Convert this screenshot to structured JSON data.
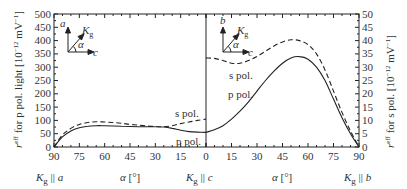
{
  "chart_data": {
    "type": "line",
    "title": "",
    "panels": [
      {
        "name": "left",
        "x_direction": "reversed",
        "x_ticks": [
          90,
          75,
          60,
          45,
          30,
          15,
          0
        ],
        "x_start_label": "K_g || a",
        "x_end_label": "K_g || c",
        "xlabel": "α [°]",
        "ylabel": "r^eff for p pol. light [10^-12 mV^-1]",
        "ylim": [
          0,
          500
        ],
        "y_ticks": [
          0,
          50,
          100,
          150,
          200,
          250,
          300,
          350,
          400,
          450,
          500
        ],
        "inset": {
          "vertical_axis": "a",
          "horizontal_axis": "c",
          "vector": "K_g",
          "angle": "α"
        },
        "series": [
          {
            "name": "s pol.",
            "style": "dashed",
            "x": [
              90,
              85,
              80,
              75,
              70,
              65,
              60,
              55,
              50,
              45,
              40,
              35,
              30,
              25,
              20,
              15,
              10,
              5,
              0
            ],
            "y": [
              0,
              45,
              70,
              85,
              92,
              95,
              94,
              92,
              89,
              85,
              82,
              79,
              77,
              76,
              80,
              88,
              94,
              100,
              105
            ]
          },
          {
            "name": "p pol.",
            "style": "solid",
            "x": [
              90,
              85,
              80,
              75,
              70,
              65,
              60,
              55,
              50,
              45,
              40,
              35,
              30,
              25,
              20,
              15,
              10,
              5,
              0
            ],
            "y": [
              0,
              38,
              60,
              72,
              78,
              80,
              80,
              79,
              78,
              77,
              76,
              76,
              76,
              75,
              70,
              63,
              58,
              56,
              55
            ]
          }
        ],
        "annotations": [
          "s pol.",
          "p pol."
        ]
      },
      {
        "name": "right",
        "x_direction": "normal",
        "x_ticks": [
          0,
          15,
          30,
          45,
          60,
          75,
          90
        ],
        "x_start_label": "K_g || c",
        "x_end_label": "K_g || b",
        "xlabel": "α [°]",
        "ylabel": "r^eff for s pol. [10^-12 mV^-1]",
        "ylim": [
          0,
          50
        ],
        "y_ticks": [
          0,
          5,
          10,
          15,
          20,
          25,
          30,
          35,
          40,
          45,
          50
        ],
        "inset": {
          "vertical_axis": "b",
          "horizontal_axis": "c",
          "vector": "K_g",
          "angle": "α"
        },
        "series": [
          {
            "name": "s pol.",
            "style": "dashed",
            "x": [
              0,
              5,
              10,
              15,
              20,
              25,
              30,
              35,
              40,
              45,
              50,
              55,
              60,
              65,
              70,
              75,
              80,
              85,
              90
            ],
            "y": [
              33.5,
              33.3,
              32.5,
              31.5,
              31.5,
              32.5,
              34,
              36,
              38,
              39.5,
              40.3,
              40,
              38.5,
              35,
              29,
              21,
              13,
              6,
              0
            ]
          },
          {
            "name": "p pol.",
            "style": "solid",
            "x": [
              0,
              5,
              10,
              15,
              20,
              25,
              30,
              35,
              40,
              45,
              50,
              55,
              60,
              65,
              70,
              75,
              80,
              85,
              90
            ],
            "y": [
              5.5,
              6.5,
              8,
              10.5,
              13.5,
              17,
              21,
              25,
              28.5,
              31.5,
              33.5,
              34,
              33,
              30,
              25,
              18,
              11,
              5,
              0
            ]
          }
        ],
        "annotations": [
          "s pol.",
          "p pol."
        ]
      }
    ],
    "grid": false,
    "legend": "inline text labels"
  },
  "labels": {
    "left_ylabel_main": "r",
    "left_ylabel_sup": "eff",
    "left_ylabel_rest": " for p pol. light [10",
    "left_ylabel_exp": "−12",
    "left_ylabel_unit": " mV",
    "left_ylabel_unit_exp": "−1",
    "left_ylabel_close": "]",
    "right_ylabel_main": "r",
    "right_ylabel_sup": "eff",
    "right_ylabel_rest": " for s pol. [10",
    "right_ylabel_exp": "−12",
    "right_ylabel_unit": " mV",
    "right_ylabel_unit_exp": "−1",
    "right_ylabel_close": "]",
    "xlabel_alpha": "α",
    "xlabel_unit": " [°]",
    "kg_main": "K",
    "kg_sub": "g",
    "parallel": " || ",
    "axis_a": "a",
    "axis_b": "b",
    "axis_c": "c",
    "alpha": "α",
    "s_pol": "s pol.",
    "p_pol": "p pol."
  }
}
